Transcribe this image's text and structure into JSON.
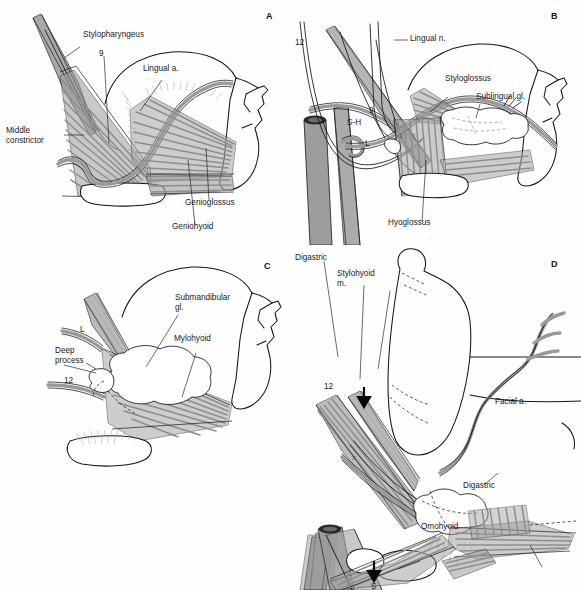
{
  "figure": {
    "panel_count": 4,
    "background_color": "#ffffff",
    "ink_color": "#1a1a1a",
    "muscle_fill_color": "#9d9d9d",
    "vessel_fill_color": "#9a9a9a",
    "caption": ""
  },
  "panels": [
    {
      "id": "A",
      "letter": "A",
      "labels": [
        {
          "key": "stylopharyngeus",
          "text": "Stylopharyngeus"
        },
        {
          "key": "nine",
          "text": "9"
        },
        {
          "key": "lingual_a",
          "text": "Lingual a."
        },
        {
          "key": "middle_constrictor_l1",
          "text": "Middle"
        },
        {
          "key": "middle_constrictor_l2",
          "text": "constrictor"
        },
        {
          "key": "genioglossus",
          "text": "Genioglossus"
        },
        {
          "key": "geniohyoid",
          "text": "Geniohyoid"
        }
      ]
    },
    {
      "id": "B",
      "letter": "B",
      "labels": [
        {
          "key": "twelve",
          "text": "12"
        },
        {
          "key": "lingual_n",
          "text": "Lingual n."
        },
        {
          "key": "styloglossus",
          "text": "Styloglossus"
        },
        {
          "key": "sublingual_gl",
          "text": "Sublingual gl."
        },
        {
          "key": "sh",
          "text": "S-H"
        },
        {
          "key": "nine",
          "text": "9"
        },
        {
          "key": "l",
          "text": "L"
        },
        {
          "key": "hyoglossus",
          "text": "Hyoglossus"
        }
      ]
    },
    {
      "id": "C",
      "letter": "C",
      "labels": [
        {
          "key": "submandibular_gl_l1",
          "text": "Submandibular"
        },
        {
          "key": "submandibular_gl_l2",
          "text": "gl."
        },
        {
          "key": "mylohyoid",
          "text": "Mylohyoid"
        },
        {
          "key": "deep_process_l1",
          "text": "Deep"
        },
        {
          "key": "deep_process_l2",
          "text": "process"
        },
        {
          "key": "l",
          "text": "L"
        },
        {
          "key": "twelve",
          "text": "12"
        }
      ]
    },
    {
      "id": "D",
      "letter": "D",
      "labels": [
        {
          "key": "digastric_top",
          "text": "Digastric"
        },
        {
          "key": "stylohyoid_l1",
          "text": "Stylohyoid"
        },
        {
          "key": "stylohyoid_l2",
          "text": "m."
        },
        {
          "key": "twelve",
          "text": "12"
        },
        {
          "key": "facial_a",
          "text": "Facial a."
        },
        {
          "key": "digastric_bottom",
          "text": "Digastric"
        },
        {
          "key": "omohyoid",
          "text": "Omohyoid"
        },
        {
          "key": "s_marker",
          "text": "S"
        },
        {
          "key": "x_marker",
          "text": "x"
        }
      ]
    }
  ]
}
